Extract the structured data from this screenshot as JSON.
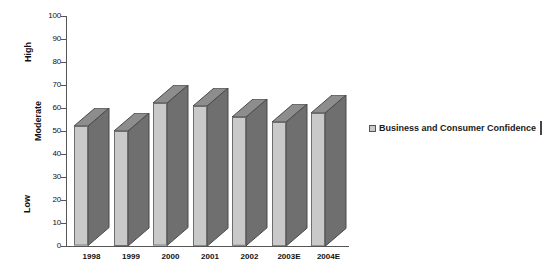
{
  "chart_data": {
    "type": "bar",
    "title": "",
    "subtitle": "",
    "xlabel": "",
    "ylabel": "",
    "categories": [
      "1998",
      "1999",
      "2000",
      "2001",
      "2002",
      "2003E",
      "2004E"
    ],
    "values": [
      52,
      50,
      62,
      61,
      56,
      54,
      58
    ],
    "series": [
      {
        "name": "Business and Consumer Confidence",
        "values": [
          52,
          50,
          62,
          61,
          56,
          54,
          58
        ]
      }
    ],
    "ylim": [
      0,
      100
    ],
    "y_ticks": [
      0,
      10,
      20,
      30,
      40,
      50,
      60,
      70,
      80,
      90,
      100
    ],
    "y_tick_labels": [
      "0",
      "10",
      "20",
      "30",
      "40",
      "50",
      "60",
      "70",
      "80",
      "90",
      "100"
    ],
    "y_category_labels": [
      {
        "label": "Low",
        "at": 18
      },
      {
        "label": "Moderate",
        "at": 54
      },
      {
        "label": "High",
        "at": 84
      }
    ],
    "grid": false,
    "legend": {
      "position": "right",
      "entries": [
        {
          "label": "Business and Consumer Confidence",
          "color": "#c9c9c9"
        }
      ]
    },
    "style": {
      "three_d": true,
      "bar_front_color": "#c9c9c9",
      "bar_side_color": "#6f6f6f",
      "bar_top_color": "#8d8d8d",
      "axis_color": "#555555",
      "background": "#ffffff",
      "text_color": "#111111"
    }
  }
}
